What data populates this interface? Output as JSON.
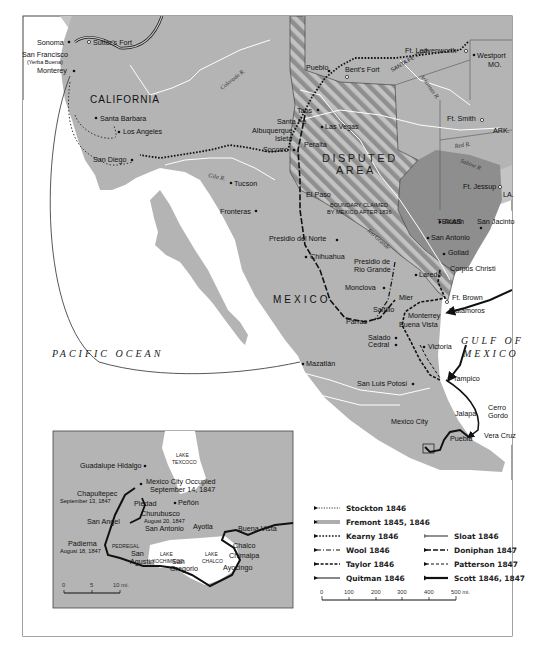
{
  "map": {
    "colors": {
      "land": "#b4b4b4",
      "us_land": "#c4c4c4",
      "texas": "#8e8e8e",
      "disputed_stripe": "#9a9a9a",
      "water": "#ffffff",
      "route": "#111111"
    },
    "regions": {
      "california": "CALIFORNIA",
      "mexico": "MEXICO",
      "texas": "TEXAS",
      "disputed_line1": "DISPUTED",
      "disputed_line2": "AREA",
      "boundary_line1": "BOUNDARY CLAIMED",
      "boundary_line2": "BY MEXICO AFTER 1836",
      "missouri": "MO.",
      "arkansas": "ARK.",
      "louisiana": "LA."
    },
    "water": {
      "pacific": "PACIFIC OCEAN",
      "gulf_line1": "GULF OF",
      "gulf_line2": "MEXICO"
    },
    "rivers": {
      "colorado": "Colorado R.",
      "gila": "Gila R.",
      "arkansas": "Arkansas R.",
      "red": "Red R.",
      "sabine": "Sabine R.",
      "rio_grande": "Rio Grande",
      "santa_fe_trail": "SANTA FE TRAIL"
    },
    "places": {
      "sonoma": "Sonoma",
      "sutters_fort": "Sutter's Fort",
      "san_francisco": "San Francisco",
      "yerba_buena": "(Yerba Buena)",
      "monterey_ca": "Monterey",
      "santa_barbara": "Santa Barbara",
      "los_angeles": "Los Angeles",
      "san_diego": "San Diego",
      "tucson": "Tucson",
      "fronteras": "Fronteras",
      "pueblo": "Pueblo",
      "bents_fort": "Bent's Fort",
      "ft_leavenworth": "Ft. Leavenworth",
      "westport": "Westport",
      "taos": "Taos",
      "santa_fe": "Santa Fé",
      "las_vegas": "Las Vegas",
      "albuquerque": "Albuquerque",
      "isleta": "Isleta",
      "peralta": "Peralta",
      "socorro": "Socorro",
      "ft_smith": "Ft. Smith",
      "ft_jessup": "Ft. Jessup",
      "el_paso": "El Paso",
      "presidio_del_norte": "Presidio del Norte",
      "chihuahua": "Chihuahua",
      "presidio_rio_grande_1": "Presidio de",
      "presidio_rio_grande_2": "Rio Grande",
      "austin": "Austin",
      "san_jacinto": "San Jacinto",
      "san_antonio": "San Antonio",
      "goliad": "Goliad",
      "laredo": "Laredo",
      "corpus_christi": "Corpus Christi",
      "monclova": "Monclova",
      "mier": "Mier",
      "ft_brown": "Ft. Brown",
      "matamoros": "Matamoros",
      "saltillo": "Saltillo",
      "monterrey": "Monterrey",
      "parras": "Parras",
      "buena_vista": "Buena Vista",
      "salado": "Salado",
      "cedral": "Cedral",
      "victoria": "Victoria",
      "mazatlan": "Mazatlán",
      "san_luis_potosi": "San Luis Potosí",
      "tampico": "Tampico",
      "cerro": "Cerro",
      "gordo": "Gordo",
      "jalapa": "Jalapa",
      "mexico_city": "Mexico City",
      "puebla": "Puebla",
      "vera_cruz": "Vera Cruz"
    }
  },
  "inset": {
    "lakes": {
      "texcoco_1": "LAKE",
      "texcoco_2": "TEXCOCO",
      "xochimilco_1": "LAKE",
      "xochimilco_2": "XOCHIMILCO",
      "chalco_1": "LAKE",
      "chalco_2": "CHALCO",
      "pedregal": "PEDREGAL"
    },
    "places": {
      "guadalupe_hidalgo": "Guadalupe Hidalgo",
      "mexico_city_occupied": "Mexico City Occupied",
      "mexico_city_date": "September 14, 1847",
      "chapultepec": "Chapultepec",
      "chapultepec_date": "September 13, 1847",
      "piedad": "Piedad",
      "penon": "Peñón",
      "churubusco": "Churubusco",
      "churubusco_date": "August 20, 1847",
      "san_angel": "San Angel",
      "san_antonio": "San Antonio",
      "ayotla": "Ayotla",
      "buena_vista": "Buena Vista",
      "padierna": "Padierna",
      "padierna_date": "August 18, 1847",
      "san_agustin_1": "San",
      "san_agustin_2": "Agustin",
      "san_gregorio_1": "San",
      "san_gregorio_2": "Gregorio",
      "chalco": "Chalco",
      "chimalpa": "Chimalpa",
      "ayocingo": "Ayocingo"
    },
    "scale": {
      "ticks": [
        "0",
        "5",
        "10 mi."
      ]
    }
  },
  "legend": {
    "items": [
      {
        "name": "Stockton 1846",
        "style": "open-circles"
      },
      {
        "name": "Fremont 1845, 1846",
        "style": "double-line"
      },
      {
        "name": "Kearny  1846",
        "style": "dotted"
      },
      {
        "name": "Wool  1846",
        "style": "dash-dot"
      },
      {
        "name": "Taylor  1846",
        "style": "short-dash"
      },
      {
        "name": "Quitman  1846",
        "style": "thin-solid"
      },
      {
        "name": "Sloat  1846",
        "style": "gray-thick"
      },
      {
        "name": "Doniphan  1847",
        "style": "long-dash"
      },
      {
        "name": "Patterson  1847",
        "style": "thin-dash"
      },
      {
        "name": "Scott  1846, 1847",
        "style": "thick-solid"
      }
    ]
  },
  "scale": {
    "ticks": [
      "0",
      "100",
      "200",
      "300",
      "400",
      "500 mi."
    ]
  }
}
